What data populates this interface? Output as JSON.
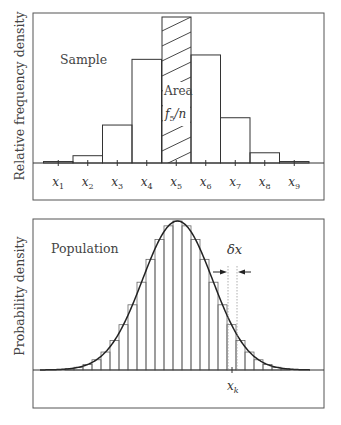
{
  "chart_data": [
    {
      "type": "bar",
      "title": "Sample",
      "ylabel": "Relative frequency density",
      "xlabel": "",
      "categories": [
        "x1",
        "x2",
        "x3",
        "x4",
        "x5",
        "x6",
        "x7",
        "x8",
        "x9"
      ],
      "category_labels": [
        {
          "base": "x",
          "sub": "1"
        },
        {
          "base": "x",
          "sub": "2"
        },
        {
          "base": "x",
          "sub": "3"
        },
        {
          "base": "x",
          "sub": "4"
        },
        {
          "base": "x",
          "sub": "5"
        },
        {
          "base": "x",
          "sub": "6"
        },
        {
          "base": "x",
          "sub": "7"
        },
        {
          "base": "x",
          "sub": "8"
        },
        {
          "base": "x",
          "sub": "9"
        }
      ],
      "values": [
        0.01,
        0.05,
        0.26,
        0.71,
        1.0,
        0.74,
        0.31,
        0.07,
        0.01
      ],
      "highlighted_index": 4,
      "annotation": {
        "line1": "Area",
        "line2_base": "f",
        "line2_sub": "5",
        "line2_rest": "/n"
      },
      "grid": false,
      "legend": null
    },
    {
      "type": "area",
      "title": "Population",
      "ylabel": "Probability density",
      "xlabel": "",
      "description": "Normal density curve overlaid with narrow histogram bars of width δx",
      "distribution": {
        "kind": "normal",
        "mean_px": 177.5,
        "sigma_px": 35
      },
      "bin_width_label": "δx",
      "marked_tick": {
        "base": "x",
        "sub": "k"
      },
      "grid": false,
      "legend": null
    }
  ],
  "top": {
    "label": "Sample",
    "ylabel": "Relative frequency density",
    "area_label": "Area"
  },
  "bottom": {
    "label": "Population",
    "ylabel": "Probability density",
    "delta_label": "δx"
  }
}
